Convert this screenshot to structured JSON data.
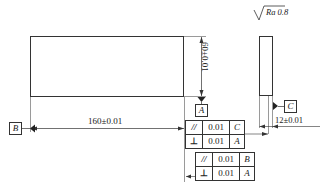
{
  "surface_finish": {
    "symbol": "√",
    "label": "Ra 0.8"
  },
  "dimensions": {
    "height": "60±0.01",
    "length": "160±0.01",
    "thickness": "12±0.01"
  },
  "datums": {
    "a": "A",
    "b": "B",
    "c": "C"
  },
  "feature_control_frames": [
    {
      "rows": [
        {
          "symbol": "//",
          "tolerance": "0.01",
          "datum": "C"
        },
        {
          "symbol": "⊥",
          "tolerance": "0.01",
          "datum": "A"
        }
      ]
    },
    {
      "rows": [
        {
          "symbol": "//",
          "tolerance": "0.01",
          "datum": "B"
        },
        {
          "symbol": "⊥",
          "tolerance": "0.01",
          "datum": "A"
        }
      ]
    }
  ],
  "colors": {
    "line": "#333333",
    "background": "#ffffff"
  }
}
